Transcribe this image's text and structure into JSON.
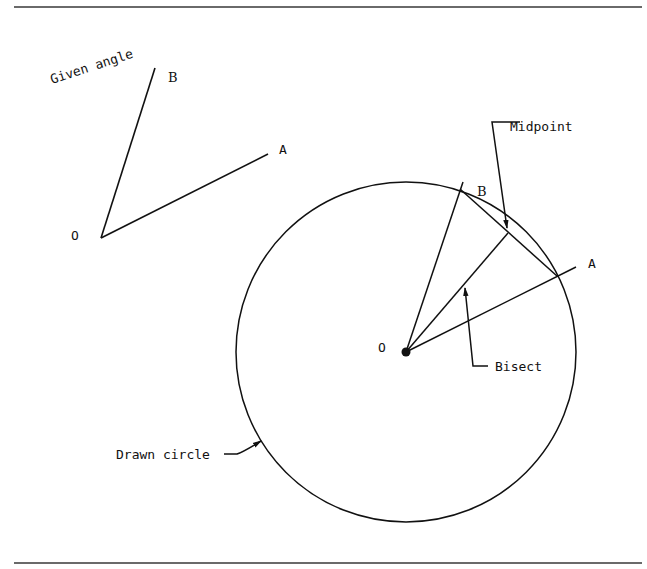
{
  "figure": {
    "title_label": "Given angle",
    "given_angle": {
      "vertex_label": "O",
      "ray_a_label": "A",
      "ray_b_label": "B",
      "vertex": [
        101,
        238
      ],
      "ray_a_end": [
        268,
        154
      ],
      "ray_b_end": [
        155,
        68
      ]
    },
    "construction": {
      "center_label": "O",
      "ray_a_label": "A",
      "ray_b_label": "B",
      "center": [
        406,
        352
      ],
      "radius": 170,
      "ray_a_end": [
        576,
        268
      ],
      "ray_b_end": [
        463,
        182
      ],
      "point_b": [
        460,
        189
      ],
      "point_a": [
        557,
        276
      ],
      "midpoint": [
        508,
        233
      ]
    },
    "callouts": {
      "midpoint": "Midpoint",
      "bisect": "Bisect",
      "drawn_circle": "Drawn circle"
    },
    "colors": {
      "line": "#111111",
      "rule": "#6a6a6a",
      "background": "#ffffff"
    }
  }
}
